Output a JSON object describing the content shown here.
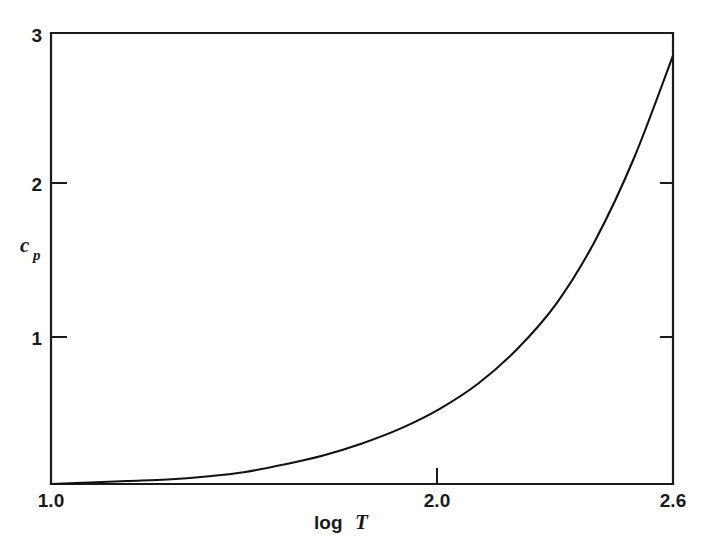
{
  "chart_data": {
    "type": "line",
    "title": "",
    "subtitle": "",
    "xlabel_prefix": "log",
    "xlabel_symbol": "T",
    "xlabel": "log T",
    "ylabel_symbol": "c",
    "ylabel_subscript": "p",
    "ylabel": "c_p",
    "xlim": [
      1.0,
      2.6
    ],
    "ylim": [
      0,
      3
    ],
    "grid": false,
    "legend": "none",
    "xticks": [
      1.0,
      2.0,
      2.6
    ],
    "xticklabels": [
      "1.0",
      "2.0",
      "2.6"
    ],
    "yticks": [
      1,
      2,
      3
    ],
    "yticklabels": [
      "1",
      "2",
      "3"
    ],
    "series": [
      {
        "name": "heat capacity",
        "x": [
          1.0,
          1.1,
          1.2,
          1.3,
          1.4,
          1.5,
          1.6,
          1.7,
          1.8,
          1.9,
          2.0,
          2.1,
          2.2,
          2.3,
          2.4,
          2.5,
          2.6
        ],
        "y": [
          0.0,
          0.01,
          0.02,
          0.03,
          0.05,
          0.08,
          0.13,
          0.19,
          0.27,
          0.37,
          0.5,
          0.67,
          0.9,
          1.2,
          1.62,
          2.17,
          2.85
        ]
      }
    ]
  },
  "axes": {
    "y_tick_3": "3",
    "y_tick_2": "2",
    "y_tick_1": "1",
    "x_tick_left": "1.0",
    "x_tick_mid": "2.0",
    "x_tick_right": "2.6",
    "x_label_text": "log",
    "x_label_var": "T",
    "y_label_var": "c",
    "y_label_sub": "p"
  }
}
